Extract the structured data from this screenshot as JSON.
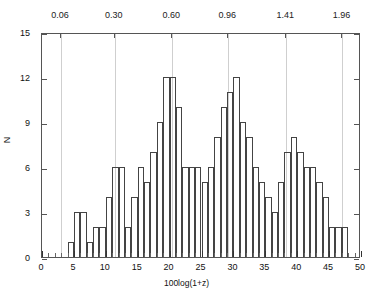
{
  "chart_data": {
    "type": "bar",
    "title": "",
    "xlabel": "100log(1+z)",
    "ylabel": "N",
    "xlim": [
      0,
      50
    ],
    "ylim": [
      0,
      15
    ],
    "bin_width": 1,
    "grid": true,
    "legend": null,
    "categories": [
      4,
      5,
      6,
      7,
      8,
      9,
      10,
      11,
      12,
      13,
      14,
      15,
      16,
      17,
      18,
      19,
      20,
      21,
      22,
      23,
      24,
      25,
      26,
      27,
      28,
      29,
      30,
      31,
      32,
      33,
      34,
      35,
      36,
      37,
      38,
      39,
      40,
      41,
      42,
      43,
      44,
      45,
      46,
      47
    ],
    "values": [
      1,
      3,
      3,
      1,
      2,
      2,
      4,
      6,
      6,
      2,
      4,
      6,
      5,
      7,
      9,
      12,
      12,
      10,
      6,
      6,
      6,
      5,
      6,
      8,
      10,
      11,
      12,
      9,
      8,
      6,
      5,
      4,
      3,
      5,
      7,
      8,
      7,
      6,
      6,
      5,
      4,
      2,
      2,
      2
    ],
    "x_ticks_major": [
      0,
      5,
      10,
      15,
      20,
      25,
      30,
      35,
      40,
      45,
      50
    ],
    "x_ticks_minor_step": 1,
    "y_ticks": [
      0,
      3,
      6,
      9,
      12,
      15
    ],
    "top_axis": {
      "label": "",
      "ticks": [
        {
          "value": 0.06,
          "x": 3.0
        },
        {
          "value": 0.3,
          "x": 11.4
        },
        {
          "value": 0.6,
          "x": 20.4
        },
        {
          "value": 0.96,
          "x": 29.2
        },
        {
          "value": 1.41,
          "x": 38.3
        },
        {
          "value": 1.96,
          "x": 47.1
        }
      ],
      "tick_labels": [
        "0.06",
        "0.30",
        "0.60",
        "0.96",
        "1.41",
        "1.96"
      ]
    }
  },
  "axes": {
    "x_tick_labels": [
      "0",
      "5",
      "10",
      "15",
      "20",
      "25",
      "30",
      "35",
      "40",
      "45",
      "50"
    ],
    "y_tick_labels": [
      "0",
      "3",
      "6",
      "9",
      "12",
      "15"
    ],
    "xlabel_text": "100log(1+z)",
    "ylabel_text": "N"
  }
}
